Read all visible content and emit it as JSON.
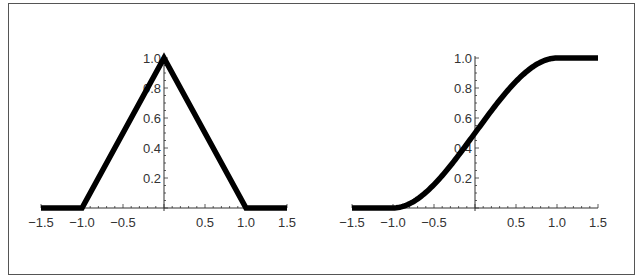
{
  "chart_data": [
    {
      "type": "line",
      "title": "",
      "xlabel": "",
      "ylabel": "",
      "xlim": [
        -1.5,
        1.5
      ],
      "ylim": [
        0,
        1.0
      ],
      "grid": false,
      "x_ticks": [
        -1.5,
        -1.0,
        -0.5,
        0.5,
        1.0,
        1.5
      ],
      "x_tick_labels": [
        "−1.5",
        "−1.0",
        "−0.5",
        "0.5",
        "1.0",
        "1.5"
      ],
      "y_ticks": [
        0.2,
        0.4,
        0.6,
        0.8,
        1.0
      ],
      "y_tick_labels": [
        "0.2",
        "0.4",
        "0.6",
        "0.8",
        "1.0"
      ],
      "series": [
        {
          "name": "triangular",
          "x": [
            -1.5,
            -1.0,
            0.0,
            1.0,
            1.5
          ],
          "y": [
            0,
            0,
            1.0,
            0,
            0
          ]
        }
      ]
    },
    {
      "type": "line",
      "title": "",
      "xlabel": "",
      "ylabel": "",
      "xlim": [
        -1.5,
        1.5
      ],
      "ylim": [
        0,
        1.0
      ],
      "grid": false,
      "x_ticks": [
        -1.5,
        -1.0,
        -0.5,
        0.5,
        1.0,
        1.5
      ],
      "x_tick_labels": [
        "−1.5",
        "−1.0",
        "−0.5",
        "0.5",
        "1.0",
        "1.5"
      ],
      "y_ticks": [
        0.2,
        0.4,
        0.6,
        0.8,
        1.0
      ],
      "y_tick_labels": [
        "0.2",
        "0.4",
        "0.6",
        "0.8",
        "1.0"
      ],
      "series": [
        {
          "name": "smooth-step",
          "x": [
            -1.5,
            -1.0,
            -0.75,
            -0.5,
            -0.25,
            0.0,
            0.25,
            0.5,
            0.75,
            1.0,
            1.5
          ],
          "y": [
            0,
            0,
            0.016,
            0.104,
            0.285,
            0.5,
            0.715,
            0.896,
            0.984,
            1.0,
            1.0
          ]
        }
      ]
    }
  ],
  "style": {
    "line_color": "#000000",
    "axis_color": "#333333",
    "frame_color": "#555555"
  }
}
